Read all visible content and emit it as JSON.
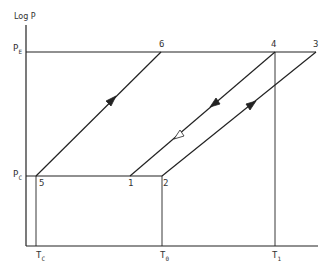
{
  "diagram": {
    "type": "log-P vs T cycle diagram",
    "y_axis_label": "Log P",
    "pressure_levels": [
      {
        "id": "PE",
        "main": "P",
        "sub": "E"
      },
      {
        "id": "PC",
        "main": "P",
        "sub": "C"
      }
    ],
    "temperature_levels": [
      {
        "id": "TC",
        "main": "T",
        "sub": "C"
      },
      {
        "id": "T0",
        "main": "T",
        "sub": "0"
      },
      {
        "id": "T1",
        "main": "T",
        "sub": "1"
      }
    ],
    "points": [
      {
        "label": "1"
      },
      {
        "label": "2"
      },
      {
        "label": "3"
      },
      {
        "label": "4"
      },
      {
        "label": "5"
      },
      {
        "label": "6"
      }
    ],
    "paths": [
      {
        "from": "5",
        "to": "6",
        "arrow": "filled, pointing up"
      },
      {
        "from": "2",
        "to": "3",
        "arrow": "filled, pointing up"
      },
      {
        "from": "4",
        "to": "1",
        "arrow": "filled down + open down"
      },
      {
        "from": "6",
        "to": "3",
        "along": "P_E"
      },
      {
        "from": "5",
        "to": "2",
        "along": "P_C"
      }
    ],
    "colors": {
      "line": "#222222",
      "background": "#ffffff"
    }
  }
}
